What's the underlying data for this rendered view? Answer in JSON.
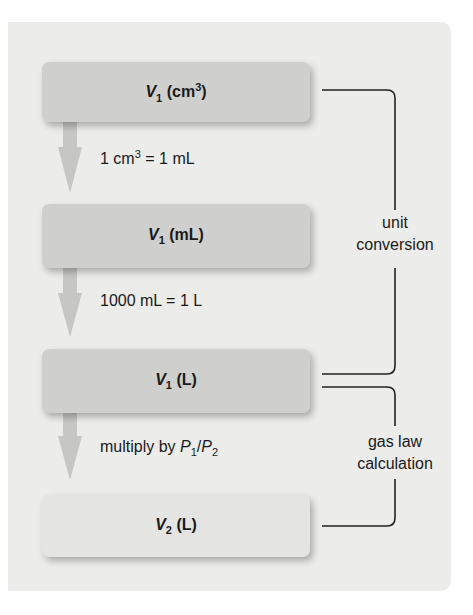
{
  "boxes": [
    {
      "var": "V",
      "sub": "1",
      "unit_pre": " (cm",
      "unit_sup": "3",
      "unit_post": ")"
    },
    {
      "var": "V",
      "sub": "1",
      "unit": " (mL)"
    },
    {
      "var": "V",
      "sub": "1",
      "unit": " (L)"
    },
    {
      "var": "V",
      "sub": "2",
      "unit": " (L)"
    }
  ],
  "steps": [
    {
      "pre": "1 cm",
      "sup": "3",
      "post": " = 1 mL"
    },
    {
      "text": "1000 mL = 1 L"
    },
    {
      "pre": "multiply by ",
      "p1": "P",
      "p1sub": "1",
      "slash": "/",
      "p2": "P",
      "p2sub": "2"
    }
  ],
  "brackets": [
    {
      "line1": "unit",
      "line2": "conversion"
    },
    {
      "line1": "gas law",
      "line2": "calculation"
    }
  ],
  "colors": {
    "panel": "#ececea",
    "box_dark": "#cfcfcd",
    "box_light": "#e4e4e2",
    "arrow": "#c8c8c6",
    "line": "#222222"
  }
}
